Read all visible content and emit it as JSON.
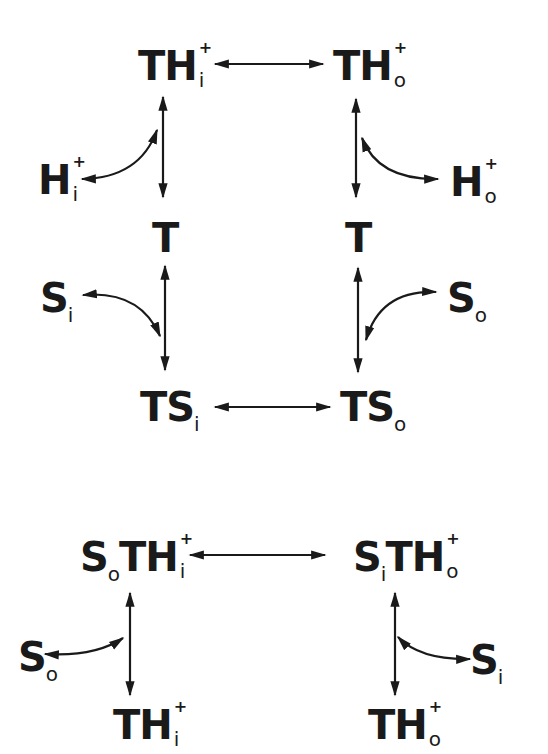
{
  "diagram": {
    "type": "transport-cycle-scheme",
    "colors": {
      "ink": "#1a1a1a",
      "background": "#ffffff"
    },
    "top_scheme": {
      "nodes": {
        "th_in": {
          "base": "TH",
          "sup": "+",
          "sub": "i"
        },
        "th_out": {
          "base": "TH",
          "sup": "+",
          "sub": "o"
        },
        "h_in": {
          "base": "H",
          "sup": "+",
          "sub": "i"
        },
        "h_out": {
          "base": "H",
          "sup": "+",
          "sub": "o"
        },
        "t_left": {
          "base": "T"
        },
        "t_right": {
          "base": "T"
        },
        "s_in": {
          "base": "S",
          "sub": "i"
        },
        "s_out": {
          "base": "S",
          "sub": "o"
        },
        "ts_in": {
          "base": "TS",
          "sub": "i"
        },
        "ts_out": {
          "base": "TS",
          "sub": "o"
        }
      },
      "edges": [
        {
          "from": "th_in",
          "to": "th_out",
          "kind": "bidirectional"
        },
        {
          "from": "th_in",
          "to": "t_left",
          "kind": "bidirectional",
          "release": "h_in"
        },
        {
          "from": "th_out",
          "to": "t_right",
          "kind": "bidirectional",
          "release": "h_out"
        },
        {
          "from": "t_left",
          "to": "ts_in",
          "kind": "bidirectional",
          "bind": "s_in"
        },
        {
          "from": "t_right",
          "to": "ts_out",
          "kind": "bidirectional",
          "bind": "s_out"
        },
        {
          "from": "ts_in",
          "to": "ts_out",
          "kind": "bidirectional"
        }
      ]
    },
    "bottom_scheme": {
      "nodes": {
        "so_th_in": {
          "parts": [
            {
              "base": "S",
              "sub": "o"
            },
            {
              "base": "TH",
              "sup": "+",
              "sub": "i"
            }
          ]
        },
        "si_th_out": {
          "parts": [
            {
              "base": "S",
              "sub": "i"
            },
            {
              "base": "TH",
              "sup": "+",
              "sub": "o"
            }
          ]
        },
        "s_out": {
          "base": "S",
          "sub": "o"
        },
        "s_in": {
          "base": "S",
          "sub": "i"
        },
        "th_in": {
          "base": "TH",
          "sup": "+",
          "sub": "i"
        },
        "th_out": {
          "base": "TH",
          "sup": "+",
          "sub": "o"
        }
      },
      "edges": [
        {
          "from": "so_th_in",
          "to": "si_th_out",
          "kind": "bidirectional"
        },
        {
          "from": "so_th_in",
          "to": "th_in",
          "kind": "bidirectional",
          "release": "s_out"
        },
        {
          "from": "si_th_out",
          "to": "th_out",
          "kind": "bidirectional",
          "release": "s_in"
        }
      ]
    }
  }
}
